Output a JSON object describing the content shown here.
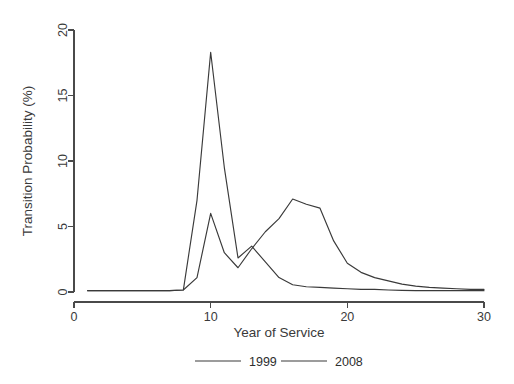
{
  "chart_data": {
    "type": "line",
    "title": "",
    "xlabel": "Year of Service",
    "ylabel": "Transition Probability (%)",
    "xlim": [
      0,
      30
    ],
    "ylim": [
      0,
      20
    ],
    "xticks": [
      0,
      10,
      20,
      30
    ],
    "xtick_labels": [
      "0",
      "10",
      "20",
      "30"
    ],
    "yticks": [
      0,
      5,
      10,
      15,
      20
    ],
    "ytick_labels": [
      "0",
      "5",
      "10",
      "15",
      "20"
    ],
    "grid": false,
    "legend_position": "bottom",
    "x": [
      1,
      2,
      3,
      4,
      5,
      6,
      7,
      8,
      9,
      10,
      11,
      12,
      13,
      14,
      15,
      16,
      17,
      18,
      19,
      20,
      21,
      22,
      23,
      24,
      25,
      26,
      27,
      28,
      29,
      30
    ],
    "series": [
      {
        "name": "1999",
        "color": "#3a3a3a",
        "values": [
          0.1,
          0.1,
          0.1,
          0.1,
          0.1,
          0.1,
          0.1,
          0.15,
          7.0,
          18.3,
          9.5,
          2.6,
          3.5,
          2.3,
          1.1,
          0.55,
          0.4,
          0.35,
          0.3,
          0.25,
          0.2,
          0.2,
          0.15,
          0.12,
          0.1,
          0.1,
          0.1,
          0.1,
          0.1,
          0.1
        ]
      },
      {
        "name": "2008",
        "color": "#3a3a3a",
        "values": [
          0.1,
          0.1,
          0.1,
          0.1,
          0.1,
          0.1,
          0.1,
          0.15,
          1.1,
          6.0,
          3.0,
          1.85,
          3.3,
          4.6,
          5.6,
          7.1,
          6.7,
          6.4,
          3.9,
          2.2,
          1.5,
          1.1,
          0.85,
          0.6,
          0.45,
          0.35,
          0.3,
          0.25,
          0.2,
          0.2
        ]
      }
    ],
    "legend": [
      {
        "label": "1999",
        "color": "#3a3a3a"
      },
      {
        "label": "2008",
        "color": "#3a3a3a"
      }
    ]
  },
  "layout": {
    "plot_left": 74,
    "plot_right": 484,
    "plot_top": 30,
    "plot_bottom": 292,
    "legend_y": 361,
    "legend_entry_x": [
      195,
      281
    ],
    "legend_line_width": 46,
    "legend_gap": 8
  }
}
